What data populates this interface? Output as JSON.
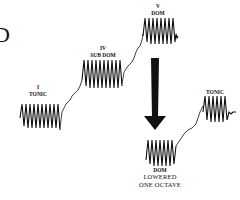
{
  "figure": {
    "partial_heading": "D",
    "stages": [
      {
        "id": "tonic-1",
        "lines": [
          "I",
          "TONIC"
        ]
      },
      {
        "id": "subdominant",
        "lines": [
          "IV",
          "SUB DOM"
        ]
      },
      {
        "id": "dominant",
        "lines": [
          "V",
          "DOM"
        ]
      },
      {
        "id": "dominant-lowered",
        "lines": [
          "DOM"
        ],
        "sublines": [
          "LOWERED",
          "ONE OCTAVE"
        ]
      },
      {
        "id": "tonic-2",
        "lines": [
          "TONIC"
        ]
      }
    ],
    "colors": {
      "ink": "#111111",
      "background": "#ffffff"
    }
  }
}
